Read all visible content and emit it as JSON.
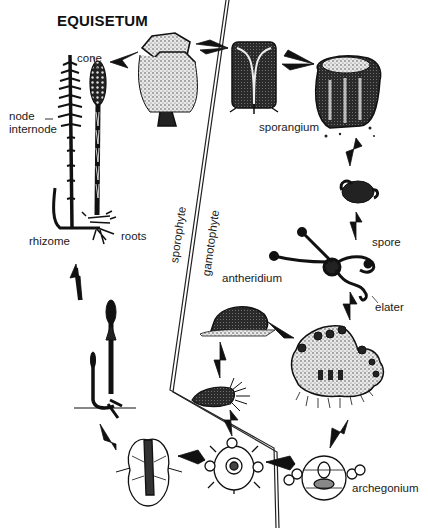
{
  "title": "EQUISETUM",
  "labels": {
    "cone": "cone",
    "node": "node",
    "internode": "internode",
    "rhizome": "rhizome",
    "roots": "roots",
    "sporangium": "sporangium",
    "spore": "spore",
    "elater": "elater",
    "antheridium": "antheridium",
    "archegonium": "archegonium"
  },
  "divider": {
    "sporophyte_label": "sporophyte",
    "gametophyte_label": "gamotophyte"
  },
  "stages": [
    {
      "id": "mature-sporophyte",
      "name": "Mature sporophyte plant with cone"
    },
    {
      "id": "cone-section",
      "name": "Sporangiophore (cone detail)"
    },
    {
      "id": "sporangiophore-section",
      "name": "Sporangiophore section"
    },
    {
      "id": "sporangium",
      "name": "Sporangium"
    },
    {
      "id": "spore-coiled",
      "name": "Spore with coiled elaters"
    },
    {
      "id": "spore-elaters",
      "name": "Spore with extended elaters"
    },
    {
      "id": "gametophyte",
      "name": "Gametophyte"
    },
    {
      "id": "antheridium",
      "name": "Antheridium"
    },
    {
      "id": "sperm",
      "name": "Sperm"
    },
    {
      "id": "archegonium",
      "name": "Archegonium"
    },
    {
      "id": "zygote",
      "name": "Fertilized egg / zygote"
    },
    {
      "id": "embryo",
      "name": "Embryo"
    },
    {
      "id": "young-sporophyte",
      "name": "Young sporophyte"
    }
  ]
}
